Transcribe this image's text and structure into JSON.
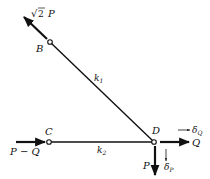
{
  "diagram": {
    "nodes": [
      {
        "id": "B",
        "label": "B"
      },
      {
        "id": "C",
        "label": "C"
      },
      {
        "id": "D",
        "label": "D"
      }
    ],
    "members": [
      {
        "id": "k1",
        "label": "k",
        "sub": "1",
        "from": "D",
        "to": "B"
      },
      {
        "id": "k2",
        "label": "k",
        "sub": "2",
        "from": "C",
        "to": "D"
      }
    ],
    "loads": {
      "at_B": {
        "sqrt": "√",
        "coef": "2",
        "var": "P"
      },
      "at_C": "P − Q",
      "at_D_horizontal": "Q",
      "at_D_vertical": "P"
    },
    "displacements": {
      "delta_Q": {
        "symbol": "δ",
        "sub": "Q"
      },
      "delta_P": {
        "symbol": "δ",
        "sub": "P"
      }
    },
    "colors": {
      "ink": "#111111",
      "background": "#ffffff"
    }
  }
}
